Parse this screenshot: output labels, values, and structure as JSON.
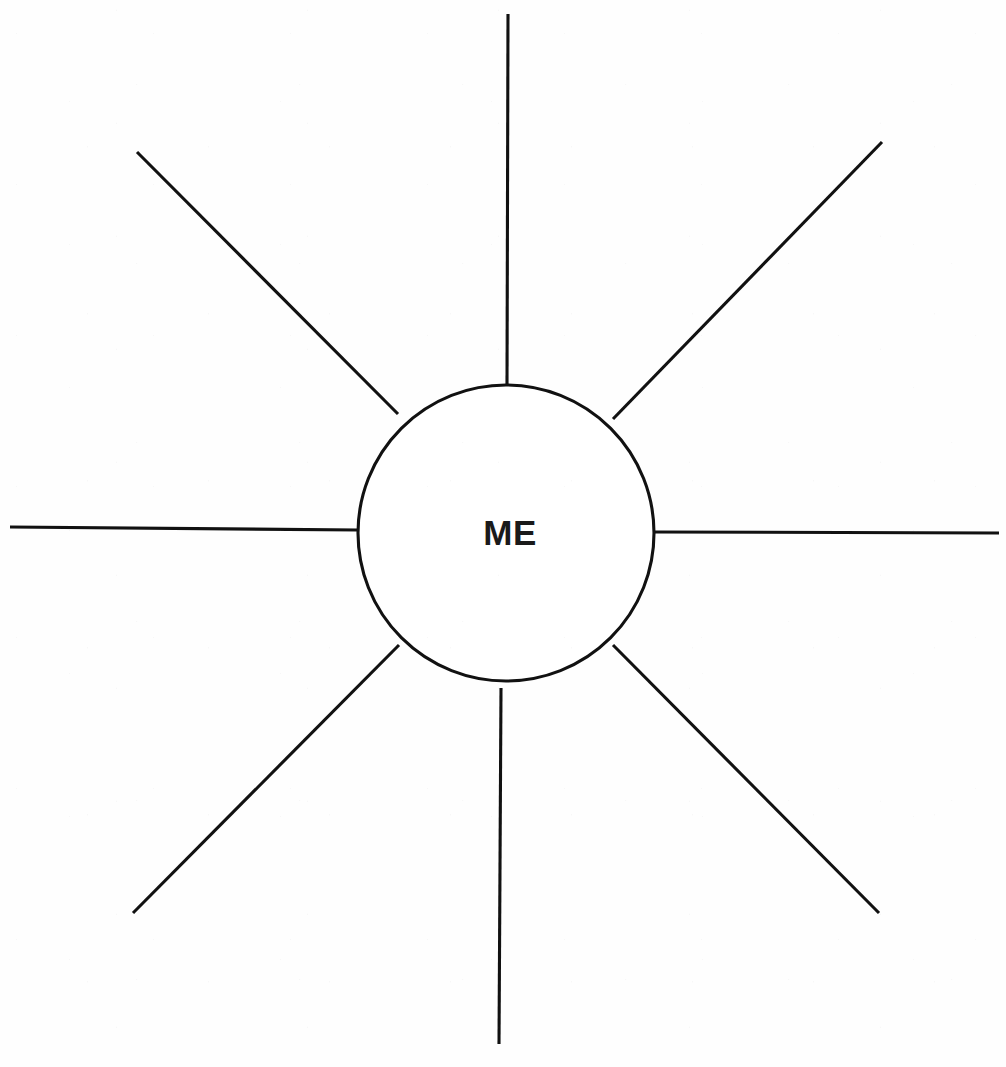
{
  "worksheet": {
    "title": "ME Spider Diagram",
    "kind": "blank-mind-map-worksheet",
    "background_color": "#fefefe",
    "ink_color": "#111111",
    "canvas": {
      "width": 1006,
      "height": 1067
    }
  },
  "hub": {
    "label": "ME",
    "center_x": 506,
    "center_y": 533,
    "radius": 148,
    "fill": "#ffffff",
    "stroke": "#111111",
    "stroke_width": 3.1,
    "label_x": 510,
    "label_y": 545,
    "label_font_size": 35,
    "label_weight": "bold"
  },
  "spokes": [
    {
      "name": "spoke-up",
      "direction": "up",
      "angle_deg": 90,
      "x1": 507,
      "y1": 385,
      "x2": 508,
      "y2": 14
    },
    {
      "name": "spoke-up-right",
      "direction": "up-right",
      "angle_deg": 45,
      "x1": 613,
      "y1": 419,
      "x2": 882,
      "y2": 142
    },
    {
      "name": "spoke-right",
      "direction": "right",
      "angle_deg": 0,
      "x1": 655,
      "y1": 532,
      "x2": 999,
      "y2": 533
    },
    {
      "name": "spoke-down-right",
      "direction": "down-right",
      "angle_deg": -45,
      "x1": 613,
      "y1": 645,
      "x2": 879,
      "y2": 913
    },
    {
      "name": "spoke-down",
      "direction": "down",
      "angle_deg": -90,
      "x1": 501,
      "y1": 688,
      "x2": 499,
      "y2": 1044
    },
    {
      "name": "spoke-down-left",
      "direction": "down-left",
      "angle_deg": -135,
      "x1": 399,
      "y1": 645,
      "x2": 133,
      "y2": 913
    },
    {
      "name": "spoke-left",
      "direction": "left",
      "angle_deg": 180,
      "x1": 358,
      "y1": 530,
      "x2": 10,
      "y2": 527
    },
    {
      "name": "spoke-up-left",
      "direction": "up-left",
      "angle_deg": 135,
      "x1": 398,
      "y1": 414,
      "x2": 137,
      "y2": 152
    }
  ],
  "spoke_count": 8,
  "branch_labels": []
}
